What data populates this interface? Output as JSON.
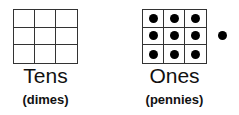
{
  "tens": {
    "label": "Tens",
    "sublabel": "(dimes)",
    "grid": {
      "rows": 3,
      "cols": 3,
      "filled_cells": 0
    }
  },
  "ones": {
    "label": "Ones",
    "sublabel": "(pennies)",
    "grid": {
      "rows": 3,
      "cols": 3,
      "filled_cells": 9
    },
    "extra_dots": 1
  },
  "colors": {
    "line": "#333333",
    "dot": "#000000",
    "background": "#ffffff"
  }
}
